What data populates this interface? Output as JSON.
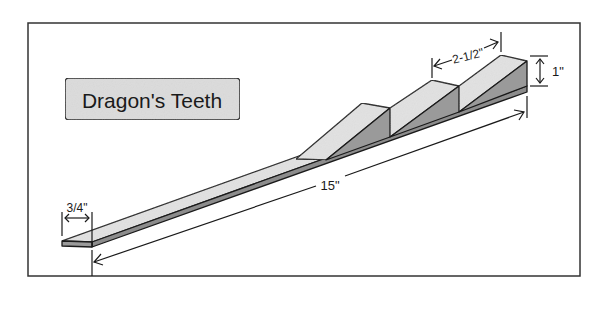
{
  "title": "Dragon's Teeth",
  "dimensions": {
    "width": "3/4\"",
    "length": "15\"",
    "spacing": "2-1/2\"",
    "height": "1\""
  },
  "colors": {
    "frame": "#333333",
    "title_fill": "#dcdcdc",
    "light_face": "#e2e2e2",
    "dark_face": "#9a9a9a",
    "board_edge": "#8c8c8c",
    "stroke": "#1a1a1a"
  }
}
